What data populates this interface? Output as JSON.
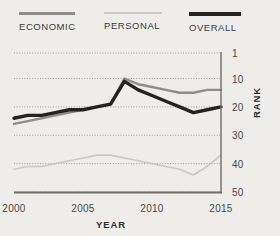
{
  "legend": {
    "items": [
      {
        "label": "ECONOMIC",
        "key": "economic",
        "color": "#8d8d8a"
      },
      {
        "label": "PERSONAL",
        "key": "personal",
        "color": "#c8c8c5"
      },
      {
        "label": "OVERALL",
        "key": "overall",
        "color": "#232322"
      }
    ]
  },
  "axes": {
    "x_title": "YEAR",
    "y_title": "RANK",
    "x_ticks": [
      "2000",
      "2005",
      "2010",
      "2015"
    ],
    "y_ticks": [
      "1",
      "10",
      "20",
      "30",
      "40",
      "50"
    ]
  },
  "chart_data": {
    "type": "line",
    "title": "",
    "xlabel": "YEAR",
    "ylabel": "RANK",
    "x": [
      2000,
      2001,
      2002,
      2003,
      2004,
      2005,
      2006,
      2007,
      2008,
      2009,
      2010,
      2011,
      2012,
      2013,
      2014,
      2015
    ],
    "xlim": [
      2000,
      2015
    ],
    "ylim": [
      1,
      50
    ],
    "y_inverted": true,
    "grid": "horizontal-dotted",
    "legend_position": "top",
    "series": [
      {
        "name": "ECONOMIC",
        "color": "#8d8d8a",
        "values": [
          26,
          25,
          24,
          23,
          22,
          21,
          20,
          19,
          10,
          12,
          13,
          14,
          15,
          15,
          14,
          14
        ]
      },
      {
        "name": "PERSONAL",
        "color": "#c8c8c5",
        "values": [
          42,
          41,
          41,
          40,
          39,
          38,
          37,
          37,
          38,
          39,
          40,
          41,
          42,
          44,
          41,
          37
        ]
      },
      {
        "name": "OVERALL",
        "color": "#232322",
        "values": [
          24,
          23,
          23,
          22,
          21,
          21,
          20,
          19,
          11,
          14,
          16,
          18,
          20,
          22,
          21,
          20
        ]
      }
    ]
  }
}
